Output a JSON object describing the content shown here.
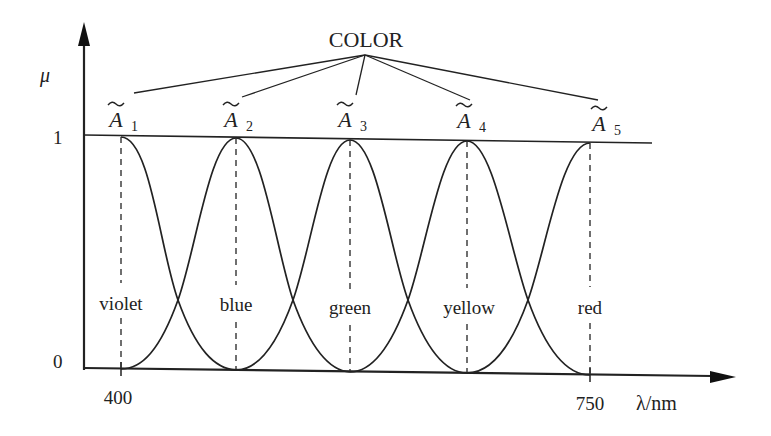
{
  "title": "COLOR",
  "axes": {
    "y_label": "μ",
    "x_label": "λ/nm",
    "y_ticks": [
      "0",
      "1"
    ],
    "x_ticks": [
      "400",
      "750"
    ]
  },
  "fuzzy_sets": [
    {
      "name": "A",
      "index": "1",
      "color_label": "violet",
      "peak_x": 121
    },
    {
      "name": "A",
      "index": "2",
      "color_label": "blue",
      "peak_x": 236
    },
    {
      "name": "A",
      "index": "3",
      "color_label": "green",
      "peak_x": 350
    },
    {
      "name": "A",
      "index": "4",
      "color_label": "yellow",
      "peak_x": 467
    },
    {
      "name": "A",
      "index": "5",
      "color_label": "red",
      "peak_x": 590
    }
  ],
  "colors": {
    "ink": "#222222",
    "background": "#ffffff"
  }
}
